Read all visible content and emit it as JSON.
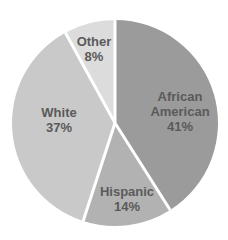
{
  "chart_data": {
    "type": "pie",
    "title": "",
    "categories": [
      "African American",
      "Hispanic",
      "White",
      "Other"
    ],
    "values": [
      41,
      14,
      37,
      8
    ],
    "unit": "%",
    "start_angle_deg": 0,
    "direction": "clockwise",
    "legend": "none (labels inside slices)",
    "slices": [
      {
        "name": "African American",
        "value": 41,
        "label_line1": "African",
        "label_line2": "American",
        "pct": "41%",
        "color": "#9b9b9b",
        "label_pos": [
          180,
          111
        ]
      },
      {
        "name": "Hispanic",
        "value": 14,
        "label_line1": "Hispanic",
        "label_line2": "",
        "pct": "14%",
        "color": "#b2b2b2",
        "label_pos": [
          127,
          199
        ]
      },
      {
        "name": "White",
        "value": 37,
        "label_line1": "White",
        "label_line2": "",
        "pct": "37%",
        "color": "#c9c9c9",
        "label_pos": [
          59,
          120
        ]
      },
      {
        "name": "Other",
        "value": 8,
        "label_line1": "Other",
        "label_line2": "",
        "pct": "8%",
        "color": "#dcdcdc",
        "label_pos": [
          94,
          49
        ]
      }
    ]
  },
  "layout": {
    "center": [
      115,
      123
    ],
    "radius": 103,
    "separator_color": "#ffffff",
    "text_color": "#5a5a5a"
  }
}
